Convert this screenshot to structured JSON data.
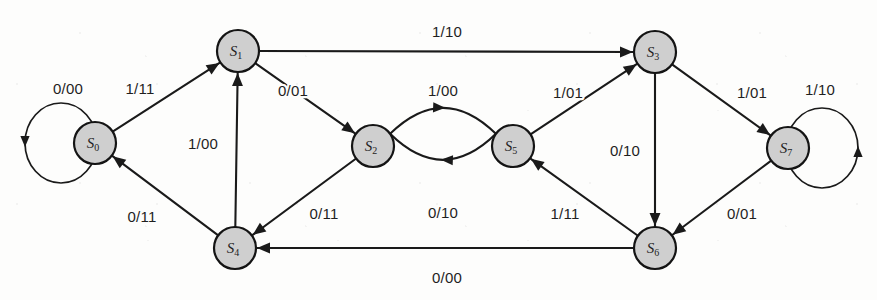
{
  "diagram": {
    "type": "finite-state-machine",
    "notation": "input/output",
    "node_radius": 21,
    "node_fill": "#cfcfcf",
    "node_stroke": "#141414",
    "edge_color": "#1a1a1a",
    "background": "#fdfdfc",
    "states": [
      {
        "id": "S0",
        "base": "S",
        "sub": "0",
        "x": 95,
        "y": 143
      },
      {
        "id": "S1",
        "base": "S",
        "sub": "1",
        "x": 238,
        "y": 51
      },
      {
        "id": "S2",
        "base": "S",
        "sub": "2",
        "x": 373,
        "y": 146
      },
      {
        "id": "S3",
        "base": "S",
        "sub": "3",
        "x": 655,
        "y": 52
      },
      {
        "id": "S4",
        "base": "S",
        "sub": "4",
        "x": 235,
        "y": 248
      },
      {
        "id": "S5",
        "base": "S",
        "sub": "5",
        "x": 513,
        "y": 146
      },
      {
        "id": "S6",
        "base": "S",
        "sub": "6",
        "x": 655,
        "y": 248
      },
      {
        "id": "S7",
        "base": "S",
        "sub": "7",
        "x": 788,
        "y": 148
      }
    ],
    "transitions": [
      {
        "from": "S0",
        "to": "S0",
        "input": "0",
        "output": "00",
        "label": "0/00",
        "label_x": 68,
        "label_y": 88,
        "kind": "self-loop-left"
      },
      {
        "from": "S0",
        "to": "S1",
        "input": "1",
        "output": "11",
        "label": "1/11",
        "label_x": 140,
        "label_y": 88,
        "kind": "straight"
      },
      {
        "from": "S1",
        "to": "S3",
        "input": "1",
        "output": "10",
        "label": "1/10",
        "label_x": 447,
        "label_y": 31,
        "kind": "straight"
      },
      {
        "from": "S1",
        "to": "S2",
        "input": "0",
        "output": "01",
        "label": "0/01",
        "label_x": 293,
        "label_y": 90,
        "kind": "straight"
      },
      {
        "from": "S4",
        "to": "S1",
        "input": "1",
        "output": "00",
        "label": "1/00",
        "label_x": 203,
        "label_y": 143,
        "kind": "straight"
      },
      {
        "from": "S2",
        "to": "S5",
        "input": "1",
        "output": "00",
        "label": "1/00",
        "label_x": 443,
        "label_y": 90,
        "kind": "arc-up"
      },
      {
        "from": "S5",
        "to": "S2",
        "input": "0",
        "output": "10",
        "label": "0/10",
        "label_x": 443,
        "label_y": 212,
        "kind": "arc-down"
      },
      {
        "from": "S2",
        "to": "S4",
        "input": "0",
        "output": "11",
        "label": "0/11",
        "label_x": 324,
        "label_y": 213,
        "kind": "straight"
      },
      {
        "from": "S5",
        "to": "S3",
        "input": "1",
        "output": "01",
        "label": "1/01",
        "label_x": 568,
        "label_y": 92,
        "kind": "straight"
      },
      {
        "from": "S3",
        "to": "S6",
        "input": "0",
        "output": "10",
        "label": "0/10",
        "label_x": 625,
        "label_y": 150,
        "kind": "straight"
      },
      {
        "from": "S3",
        "to": "S7",
        "input": "1",
        "output": "01",
        "label": "1/01",
        "label_x": 752,
        "label_y": 92,
        "kind": "straight"
      },
      {
        "from": "S6",
        "to": "S5",
        "input": "1",
        "output": "11",
        "label": "1/11",
        "label_x": 565,
        "label_y": 213,
        "kind": "straight"
      },
      {
        "from": "S7",
        "to": "S6",
        "input": "0",
        "output": "01",
        "label": "0/01",
        "label_x": 742,
        "label_y": 213,
        "kind": "straight"
      },
      {
        "from": "S7",
        "to": "S7",
        "input": "1",
        "output": "10",
        "label": "1/10",
        "label_x": 820,
        "label_y": 89,
        "kind": "self-loop-right"
      },
      {
        "from": "S4",
        "to": "S0",
        "input": "0",
        "output": "11",
        "label": "0/11",
        "label_x": 142,
        "label_y": 216,
        "kind": "straight"
      },
      {
        "from": "S6",
        "to": "S4",
        "input": "0",
        "output": "00",
        "label": "0/00",
        "label_x": 447,
        "label_y": 277,
        "kind": "straight"
      }
    ]
  }
}
